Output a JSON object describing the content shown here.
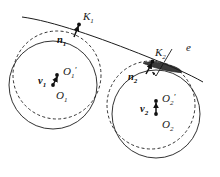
{
  "figure": {
    "background_color": "#ffffff",
    "ink_color": "#1c1c1c",
    "overlap_fill_color": "#3a3a3a",
    "width": 220,
    "height": 177
  },
  "labels": {
    "contact_point_1": "K",
    "contact_point_1_sub": "1",
    "contact_point_2": "K",
    "contact_point_2_sub": "2",
    "normal_1": "n",
    "normal_1_sub": "1",
    "normal_2": "n",
    "normal_2_sub": "2",
    "velocity_1": "v",
    "velocity_1_sub": "1",
    "velocity_2": "v",
    "velocity_2_sub": "2",
    "center_1_displaced": "O",
    "center_1_displaced_sub": "1",
    "center_1_displaced_prime": "'",
    "center_1": "O",
    "center_1_sub": "1",
    "center_2_displaced": "O",
    "center_2_displaced_sub": "2",
    "center_2_displaced_prime": "'",
    "center_2": "O",
    "center_2_sub": "2",
    "penetration": "e"
  },
  "geometry": {
    "surface_curve": "M 22,17 C 55,22 100,38 150,58 C 170,66 188,74 202,82",
    "wheel_1": {
      "solid_circle": {
        "cx": 53,
        "cy": 85,
        "r": 44
      },
      "dashed_circle": {
        "cx": 57,
        "cy": 75,
        "r": 44
      },
      "center_dot": {
        "cx": 53,
        "cy": 85
      },
      "displaced_dot": {
        "cx": 57,
        "cy": 75
      },
      "contact_point": {
        "cx": 79,
        "cy": 24
      }
    },
    "wheel_2": {
      "solid_circle": {
        "cx": 156,
        "cy": 114,
        "r": 44
      },
      "dashed_circle": {
        "cx": 151,
        "cy": 105,
        "r": 44
      },
      "center_dot": {
        "cx": 156,
        "cy": 114
      },
      "displaced_dot": {
        "cx": 156,
        "cy": 101
      },
      "contact_point": {
        "cx": 154,
        "cy": 61
      }
    },
    "normal_arrow_1": {
      "x1": 74,
      "y1": 36,
      "x2": 79,
      "y2": 25
    },
    "normal_arrow_2": {
      "x1": 146,
      "y1": 73,
      "x2": 152,
      "y2": 62
    },
    "velocity_arrow_1": {
      "x1": 53,
      "y1": 85,
      "x2": 57,
      "y2": 75
    },
    "velocity_arrow_2": {
      "x1": 156,
      "y1": 114,
      "x2": 156,
      "y2": 101
    },
    "penetration_leader": {
      "x1": 171,
      "y1": 50,
      "x2": 155,
      "y2": 77
    },
    "overlap_lens": "M 144,62 C 152,60 164,62 175,66 C 180,68 182,70 181,72 C 176,72 164,70 154,67 C 149,65 145,63 144,62 Z"
  }
}
